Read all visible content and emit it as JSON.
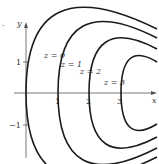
{
  "figure": {
    "marker": ".",
    "axes": {
      "x_label": "x",
      "y_label": "y",
      "x_ticks": [
        {
          "value": 1,
          "label": "1"
        },
        {
          "value": 2,
          "label": "2"
        },
        {
          "value": 3,
          "label": "3"
        }
      ],
      "y_ticks": [
        {
          "value": 1,
          "label": "1"
        },
        {
          "value": -1,
          "label": "−1"
        }
      ]
    },
    "curves": [
      {
        "label": "z = 0",
        "vertex_x": 0
      },
      {
        "label": "z = 1",
        "vertex_x": 1
      },
      {
        "label": "z = 2",
        "vertex_x": 2
      },
      {
        "label": "z = 3",
        "vertex_x": 3
      }
    ],
    "colors": {
      "curve": "#1a1a1a",
      "axis": "#555555",
      "text": "#333333"
    }
  }
}
